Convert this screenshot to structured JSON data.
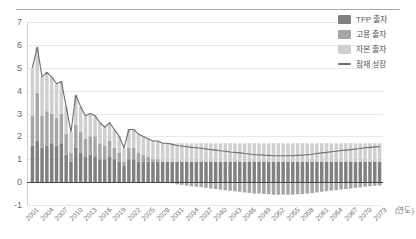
{
  "legend": {
    "items": [
      {
        "label": "TFP 출자",
        "color": "#808080",
        "marker": "box"
      },
      {
        "label": "고용 출자",
        "color": "#a6a6a6",
        "marker": "box"
      },
      {
        "label": "자본 출자",
        "color": "#cfcfcf",
        "marker": "box"
      },
      {
        "label": "잠재 성장",
        "color": "#6e6e6e",
        "marker": "line"
      }
    ]
  },
  "axis": {
    "x_unit_label": "(연도)",
    "y_ticks": [
      "7",
      "6",
      "5",
      "4",
      "3",
      "2",
      "1",
      "0",
      "-1"
    ],
    "x_ticks": [
      "2001",
      "2004",
      "2007",
      "2010",
      "2013",
      "2016",
      "2019",
      "2022",
      "2025",
      "2028",
      "2031",
      "2034",
      "2037",
      "2040",
      "2043",
      "2046",
      "2049",
      "2052",
      "2055",
      "2058",
      "2061",
      "2064",
      "2067",
      "2070",
      "2073"
    ]
  },
  "colors": {
    "tfp": "#808080",
    "labor": "#a6a6a6",
    "capital": "#cfcfcf",
    "potential_line": "#6e6e6e",
    "grid": "#e9e9e9",
    "zero_axis": "#444444",
    "text": "#6a6a6a"
  },
  "chart_data": {
    "type": "bar",
    "title": "",
    "subtitle": "",
    "xlabel": "(연도)",
    "ylabel": "",
    "ylim": [
      -1,
      7
    ],
    "grid": true,
    "stacked": true,
    "legend_position": "top-right",
    "x": [
      2001,
      2002,
      2003,
      2004,
      2005,
      2006,
      2007,
      2008,
      2009,
      2010,
      2011,
      2012,
      2013,
      2014,
      2015,
      2016,
      2017,
      2018,
      2019,
      2020,
      2021,
      2022,
      2023,
      2024,
      2025,
      2026,
      2027,
      2028,
      2029,
      2030,
      2031,
      2032,
      2033,
      2034,
      2035,
      2036,
      2037,
      2038,
      2039,
      2040,
      2041,
      2042,
      2043,
      2044,
      2045,
      2046,
      2047,
      2048,
      2049,
      2050,
      2051,
      2052,
      2053,
      2054,
      2055,
      2056,
      2057,
      2058,
      2059,
      2060,
      2061,
      2062,
      2063,
      2064,
      2065,
      2066,
      2067,
      2068,
      2069,
      2070,
      2071,
      2072,
      2073
    ],
    "series": [
      {
        "name": "TFP 출자",
        "color": "#808080",
        "values": [
          1.6,
          1.8,
          1.5,
          1.6,
          1.7,
          1.6,
          1.7,
          1.2,
          0.9,
          1.5,
          1.3,
          1.1,
          1.2,
          1.1,
          1.0,
          1.0,
          1.1,
          1.0,
          0.9,
          0.7,
          1.0,
          1.0,
          0.9,
          0.9,
          0.9,
          0.9,
          0.9,
          0.9,
          0.9,
          0.9,
          0.9,
          0.9,
          0.9,
          0.9,
          0.9,
          0.9,
          0.9,
          0.9,
          0.9,
          0.9,
          0.9,
          0.9,
          0.9,
          0.9,
          0.9,
          0.9,
          0.9,
          0.9,
          0.9,
          0.9,
          0.9,
          0.9,
          0.9,
          0.9,
          0.9,
          0.9,
          0.9,
          0.9,
          0.9,
          0.9,
          0.9,
          0.9,
          0.9,
          0.9,
          0.9,
          0.9,
          0.9,
          0.9,
          0.9,
          0.9,
          0.9,
          0.9,
          0.9
        ]
      },
      {
        "name": "고용 출자",
        "color": "#a6a6a6",
        "values": [
          1.3,
          2.1,
          1.4,
          1.5,
          1.3,
          1.2,
          1.3,
          0.9,
          0.4,
          1.0,
          0.9,
          0.8,
          0.8,
          0.9,
          0.7,
          0.6,
          0.7,
          0.5,
          0.4,
          0.2,
          0.5,
          0.5,
          0.4,
          0.3,
          0.2,
          0.1,
          0.1,
          0.0,
          0.0,
          -0.05,
          -0.1,
          -0.12,
          -0.15,
          -0.18,
          -0.2,
          -0.22,
          -0.25,
          -0.28,
          -0.3,
          -0.33,
          -0.35,
          -0.38,
          -0.4,
          -0.42,
          -0.45,
          -0.47,
          -0.5,
          -0.5,
          -0.52,
          -0.53,
          -0.55,
          -0.55,
          -0.55,
          -0.55,
          -0.55,
          -0.53,
          -0.52,
          -0.5,
          -0.48,
          -0.45,
          -0.42,
          -0.4,
          -0.37,
          -0.35,
          -0.32,
          -0.3,
          -0.28,
          -0.25,
          -0.23,
          -0.2,
          -0.18,
          -0.16,
          -0.15
        ]
      },
      {
        "name": "자본 출자",
        "color": "#cfcfcf",
        "values": [
          2.1,
          2.0,
          1.7,
          1.7,
          1.6,
          1.5,
          1.4,
          1.2,
          0.9,
          1.3,
          1.1,
          1.0,
          1.0,
          0.9,
          0.9,
          0.8,
          0.8,
          0.8,
          0.7,
          0.6,
          0.8,
          0.8,
          0.8,
          0.8,
          0.8,
          0.8,
          0.8,
          0.8,
          0.8,
          0.8,
          0.8,
          0.8,
          0.8,
          0.8,
          0.8,
          0.8,
          0.8,
          0.8,
          0.8,
          0.8,
          0.8,
          0.8,
          0.8,
          0.8,
          0.8,
          0.8,
          0.8,
          0.8,
          0.8,
          0.8,
          0.8,
          0.8,
          0.8,
          0.8,
          0.8,
          0.8,
          0.8,
          0.8,
          0.8,
          0.8,
          0.8,
          0.8,
          0.8,
          0.8,
          0.8,
          0.8,
          0.8,
          0.8,
          0.8,
          0.8,
          0.8,
          0.8,
          0.8
        ]
      }
    ],
    "line_series": {
      "name": "잠재 성장",
      "color": "#6e6e6e",
      "values": [
        5.0,
        5.9,
        4.6,
        4.8,
        4.6,
        4.3,
        4.4,
        3.3,
        2.2,
        3.8,
        3.3,
        2.9,
        3.0,
        2.9,
        2.6,
        2.4,
        2.6,
        2.3,
        2.0,
        1.5,
        2.3,
        2.3,
        2.1,
        2.0,
        1.9,
        1.8,
        1.8,
        1.7,
        1.7,
        1.65,
        1.6,
        1.58,
        1.55,
        1.52,
        1.5,
        1.48,
        1.45,
        1.42,
        1.4,
        1.37,
        1.35,
        1.32,
        1.3,
        1.28,
        1.25,
        1.23,
        1.2,
        1.2,
        1.18,
        1.17,
        1.15,
        1.15,
        1.15,
        1.15,
        1.15,
        1.17,
        1.18,
        1.2,
        1.22,
        1.25,
        1.28,
        1.3,
        1.33,
        1.35,
        1.38,
        1.4,
        1.42,
        1.45,
        1.47,
        1.5,
        1.52,
        1.54,
        1.55
      ]
    }
  }
}
